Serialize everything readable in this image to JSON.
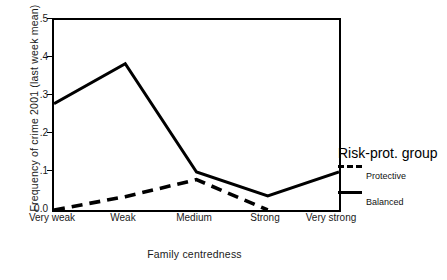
{
  "chart_data": {
    "type": "line",
    "title": "",
    "xlabel": "Family centredness",
    "ylabel": "Frequency of crime 2001 (last week mean)",
    "categories": [
      "Very weak",
      "Weak",
      "Medium",
      "Strong",
      "Very strong"
    ],
    "ylim": [
      0.0,
      0.5
    ],
    "yticks": [
      "0.0",
      ".1",
      ".2",
      ".3",
      ".4",
      ".5"
    ],
    "ytick_values": [
      0.0,
      0.1,
      0.2,
      0.3,
      0.4,
      0.5
    ],
    "grid": false,
    "legend_position": "right",
    "legend_title": "Risk-prot. group",
    "series": [
      {
        "name": "Protective",
        "style": "dashed",
        "color": "#000000",
        "values": [
          0.0,
          0.035,
          0.08,
          0.0,
          null
        ]
      },
      {
        "name": "Balanced",
        "style": "solid",
        "color": "#000000",
        "values": [
          0.28,
          0.385,
          0.1,
          0.037,
          0.1
        ]
      }
    ]
  },
  "axes": {
    "y_title": "Frequency of crime 2001 (last week mean)",
    "x_title": "Family centredness",
    "y_ticks": [
      {
        "label": ".5",
        "value": 0.5
      },
      {
        "label": ".4",
        "value": 0.4
      },
      {
        "label": ".3",
        "value": 0.3
      },
      {
        "label": ".2",
        "value": 0.2
      },
      {
        "label": ".1",
        "value": 0.1
      },
      {
        "label": "0.0",
        "value": 0.0
      }
    ],
    "x_ticks": [
      {
        "label": "Very weak"
      },
      {
        "label": "Weak"
      },
      {
        "label": "Medium"
      },
      {
        "label": "Strong"
      },
      {
        "label": "Very strong"
      }
    ]
  },
  "legend": {
    "title": "Risk-prot. group",
    "entries": [
      {
        "label": "Protective",
        "style": "dashed"
      },
      {
        "label": "Balanced",
        "style": "solid"
      }
    ]
  }
}
